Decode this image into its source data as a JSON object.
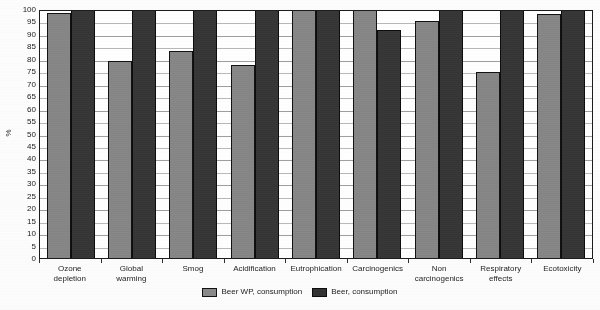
{
  "chart_data": {
    "type": "bar",
    "title": "",
    "xlabel": "",
    "ylabel": "%",
    "ylim": [
      0,
      100
    ],
    "ytick_step": 5,
    "yticks": [
      100,
      95,
      90,
      85,
      80,
      75,
      70,
      65,
      60,
      55,
      50,
      45,
      40,
      35,
      30,
      25,
      20,
      15,
      10,
      5,
      0
    ],
    "grid": true,
    "legend_position": "bottom-center",
    "categories": [
      "Ozone depletion",
      "Global warming",
      "Smog",
      "Acidification",
      "Eutrophication",
      "Carcinogenics",
      "Non carcinogenics",
      "Respiratory effects",
      "Ecotoxicity"
    ],
    "category_lines": [
      [
        "Ozone",
        "depletion"
      ],
      [
        "Global",
        "warming"
      ],
      [
        "Smog"
      ],
      [
        "Acidification"
      ],
      [
        "Eutrophication"
      ],
      [
        "Carcinogenics"
      ],
      [
        "Non",
        "carcinogenics"
      ],
      [
        "Respiratory",
        "effects"
      ],
      [
        "Ecotoxicity"
      ]
    ],
    "series": [
      {
        "name": "Beer WP, consumption",
        "color": "#8a8a8a",
        "values": [
          98.5,
          79,
          83,
          77.5,
          100,
          100,
          95,
          74.8,
          97.8
        ]
      },
      {
        "name": "Beer, consumption",
        "color": "#333333",
        "values": [
          100,
          100,
          100,
          100,
          100,
          91.5,
          100,
          100,
          100
        ]
      }
    ]
  },
  "legend": {
    "items": [
      {
        "label": "Beer WP, consumption",
        "swatch": "series-0"
      },
      {
        "label": "Beer, consumption",
        "swatch": "series-1"
      }
    ]
  },
  "colors": {
    "series_light": "#8a8a8a",
    "series_dark": "#333333",
    "axis": "#1c1c1c",
    "grid": "#b9b9b9",
    "background": "#ffffff"
  }
}
